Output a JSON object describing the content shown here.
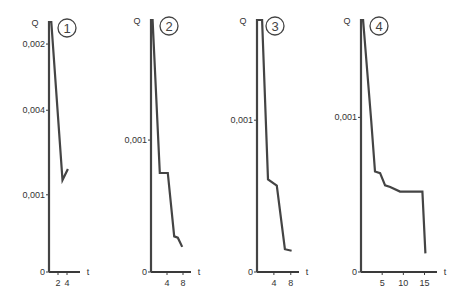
{
  "chart_data": [
    {
      "type": "line",
      "panel_label": "1",
      "ylabel": "Q",
      "xlabel": "t",
      "y_ticks": [
        {
          "label": "0,002",
          "value": 0.0062
        },
        {
          "label": "0,004",
          "value": 0.0044
        },
        {
          "label": "0,001",
          "value": 0.0021
        },
        {
          "label": "0",
          "value": 0
        }
      ],
      "x_ticks": [
        {
          "label": "2",
          "value": 2
        },
        {
          "label": "4",
          "value": 4
        }
      ],
      "xlim": [
        0,
        6
      ],
      "ylim": [
        0,
        0.0068
      ],
      "series": [
        {
          "name": "Q(t)",
          "x": [
            0,
            0,
            0.5,
            3,
            4.2
          ],
          "y": [
            0,
            0.0068,
            0.0068,
            0.0025,
            0.0028
          ]
        }
      ]
    },
    {
      "type": "line",
      "panel_label": "2",
      "ylabel": "Q",
      "xlabel": "t",
      "y_ticks": [
        {
          "label": "0,001",
          "value": 0.001
        },
        {
          "label": "0",
          "value": 0
        }
      ],
      "x_ticks": [
        {
          "label": "4",
          "value": 4
        },
        {
          "label": "8",
          "value": 8
        }
      ],
      "xlim": [
        0,
        9
      ],
      "ylim": [
        0,
        0.00191
      ],
      "series": [
        {
          "name": "Q(t)",
          "x": [
            0,
            0,
            0.4,
            2.2,
            4.2,
            5.8,
            6.7,
            7.8
          ],
          "y": [
            0,
            0.00191,
            0.00191,
            0.00075,
            0.00075,
            0.00027,
            0.00026,
            0.00019
          ]
        }
      ]
    },
    {
      "type": "line",
      "panel_label": "3",
      "ylabel": "Q",
      "xlabel": "t",
      "y_ticks": [
        {
          "label": "0,001",
          "value": 0.001
        },
        {
          "label": "0",
          "value": 0
        }
      ],
      "x_ticks": [
        {
          "label": "4",
          "value": 4
        },
        {
          "label": "8",
          "value": 8
        }
      ],
      "xlim": [
        0,
        9
      ],
      "ylim": [
        0,
        0.00166
      ],
      "series": [
        {
          "name": "Q(t)",
          "x": [
            0,
            0,
            1.2,
            2.6,
            4.7,
            6.6,
            8.2
          ],
          "y": [
            0,
            0.00166,
            0.00166,
            0.00061,
            0.00057,
            0.00015,
            0.00014
          ]
        }
      ]
    },
    {
      "type": "line",
      "panel_label": "4",
      "ylabel": "Q",
      "xlabel": "t",
      "y_ticks": [
        {
          "label": "0,001",
          "value": 0.001
        },
        {
          "label": "0",
          "value": 0
        }
      ],
      "x_ticks": [
        {
          "label": "5",
          "value": 5
        },
        {
          "label": "10",
          "value": 10
        },
        {
          "label": "15",
          "value": 15
        }
      ],
      "xlim": [
        0,
        17
      ],
      "ylim": [
        0,
        0.00163
      ],
      "series": [
        {
          "name": "Q(t)",
          "x": [
            0,
            0,
            0.5,
            2.4,
            3.3,
            4.5,
            5.7,
            6.9,
            9.2,
            14.5,
            15.2
          ],
          "y": [
            0,
            0.00163,
            0.00163,
            0.00098,
            0.00065,
            0.00064,
            0.00056,
            0.00055,
            0.00052,
            0.00052,
            0.00012
          ]
        }
      ]
    }
  ]
}
